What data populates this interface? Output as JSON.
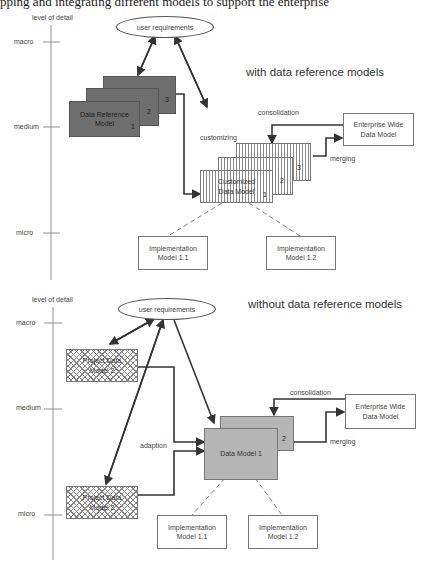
{
  "header": {
    "cut_text": "pping and integrating different models to support the enterprise"
  },
  "top": {
    "title": "with data reference models",
    "axis": {
      "label": "level of detail",
      "levels": [
        "macro",
        "medium",
        "micro"
      ]
    },
    "user_requirements": "user requirements",
    "reference_model": {
      "label": "Data Reference Model",
      "nums": [
        "1",
        "2",
        "3"
      ]
    },
    "customizing": "customizing",
    "customized_model": {
      "label": "Customized Data Model",
      "nums": [
        "1",
        "2",
        "3"
      ]
    },
    "consolidation": "consolidation",
    "merging": "merging",
    "enterprise": "Enterprise Wide Data Model",
    "impl": [
      "Implementation Model 1.1",
      "Implementation Model 1.2"
    ]
  },
  "bottom": {
    "title": "without data reference models",
    "axis": {
      "label": "level of detail",
      "levels": [
        "macro",
        "medium",
        "micro"
      ]
    },
    "user_requirements": "user requirements",
    "project_model_a": "Project Data Model 2",
    "project_model_b": "Project Data Model 2",
    "adaption": "adaption",
    "data_model": {
      "label": "Data Model 1",
      "num": "2"
    },
    "consolidation": "consolidation",
    "merging": "merging",
    "enterprise": "Enterprise Wide Data Model",
    "impl": [
      "Implementation Model 1.1",
      "Implementation Model 1.2"
    ]
  }
}
